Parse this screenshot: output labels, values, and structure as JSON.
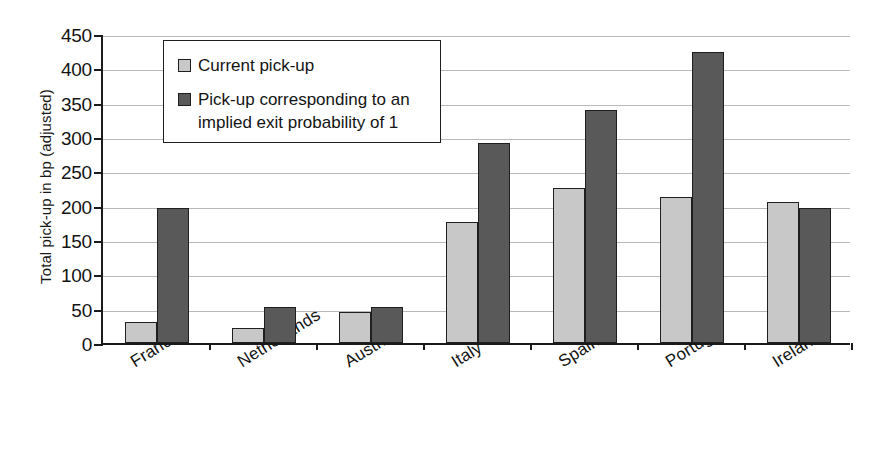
{
  "chart_data": {
    "type": "bar",
    "title": "",
    "subtitle": "",
    "xlabel": "",
    "ylabel": "Total pick-up in bp (adjusted)",
    "ylim": [
      0,
      450
    ],
    "yticks": [
      0,
      50,
      100,
      150,
      200,
      250,
      300,
      350,
      400,
      450
    ],
    "ytick_labels": [
      "0",
      "50",
      "100",
      "150",
      "200",
      "250",
      "300",
      "350",
      "400",
      "450"
    ],
    "grid": true,
    "legend_position": "top-left-inside",
    "categories": [
      "France",
      "Netherlands",
      "Austria",
      "Italy",
      "Spain",
      "Portugal",
      "Ireland"
    ],
    "series": [
      {
        "name": "Current pick-up",
        "color": "#c8c8c8",
        "values": [
          31,
          22,
          45,
          176,
          226,
          213,
          206
        ]
      },
      {
        "name": "Pick-up corresponding to an implied exit probability of 1",
        "color": "#595959",
        "values": [
          197,
          52,
          52,
          291,
          339,
          424,
          196
        ]
      }
    ]
  },
  "legend": {
    "items": [
      {
        "label": "Current pick-up",
        "swatch": "light"
      },
      {
        "label": "Pick-up corresponding to an implied exit probability of 1",
        "swatch": "dark"
      }
    ]
  },
  "colors": {
    "series_light": "#c8c8c8",
    "series_dark": "#595959",
    "axis": "#1b1b1b",
    "gridline": "#b9b9b9",
    "background": "#ffffff"
  }
}
